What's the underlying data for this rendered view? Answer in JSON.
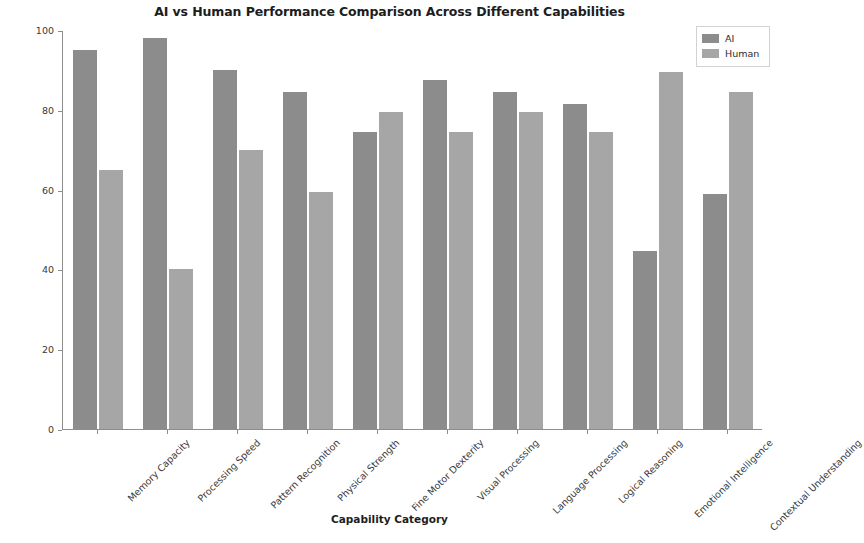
{
  "chart_data": {
    "type": "bar",
    "title": "AI vs Human Performance Comparison Across Different Capabilities",
    "xlabel": "Capability Category",
    "ylabel": "Performance Score (0-100)",
    "ylim": [
      0,
      100
    ],
    "yticks": [
      0,
      20,
      40,
      60,
      80,
      100
    ],
    "grid": false,
    "legend_position": "upper right",
    "categories": [
      "Memory Capacity",
      "Processing Speed",
      "Pattern Recognition",
      "Physical Strength",
      "Fine Motor Dexterity",
      "Visual Processing",
      "Language Processing",
      "Logical Reasoning",
      "Emotional Intelligence",
      "Contextual Understanding"
    ],
    "series": [
      {
        "name": "AI",
        "color": "#8c8c8c",
        "values": [
          95,
          98,
          90,
          84.5,
          74.5,
          87.5,
          84.5,
          81.5,
          44.5,
          59
        ]
      },
      {
        "name": "Human",
        "color": "#a6a6a6",
        "values": [
          65,
          40,
          70,
          59.5,
          79.5,
          74.5,
          79.5,
          74.5,
          89.5,
          84.5
        ]
      }
    ]
  },
  "legend": {
    "items": [
      {
        "label": "AI",
        "color": "#8c8c8c"
      },
      {
        "label": "Human",
        "color": "#a6a6a6"
      }
    ]
  }
}
